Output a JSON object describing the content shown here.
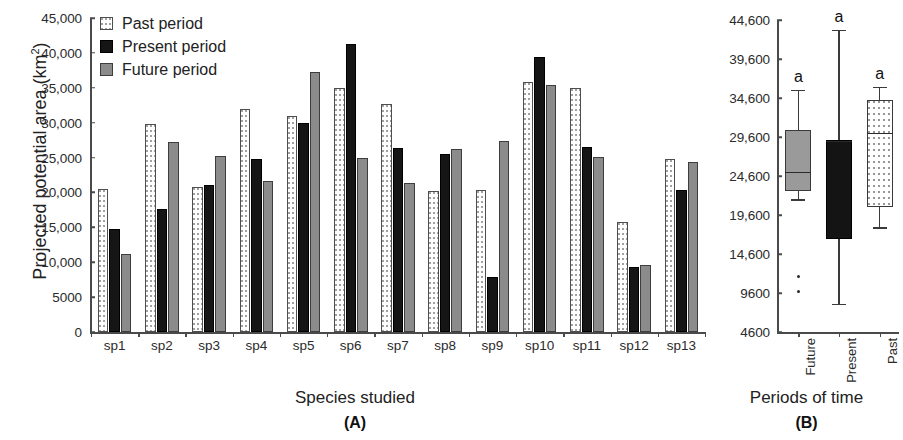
{
  "chart_data": [
    {
      "type": "bar",
      "panel": "(A)",
      "title": "",
      "xlabel": "Species studied",
      "ylabel": "Projected potential area (km2)",
      "ylabel_base": "Projected potential area (km",
      "ylabel_sup": "2",
      "ylabel_tail": ")",
      "ylim": [
        0,
        45000
      ],
      "ytick_step": 5000,
      "yticks": [
        "0",
        "5000",
        "10,000",
        "15,000",
        "20,000",
        "25,000",
        "30,000",
        "35,000",
        "40,000",
        "45,000"
      ],
      "ytick_values": [
        0,
        5000,
        10000,
        15000,
        20000,
        25000,
        30000,
        35000,
        40000,
        45000
      ],
      "grid": false,
      "legend_position": "top-left",
      "categories": [
        "sp1",
        "sp2",
        "sp3",
        "sp4",
        "sp5",
        "sp6",
        "sp7",
        "sp8",
        "sp9",
        "sp10",
        "sp11",
        "sp12",
        "sp13"
      ],
      "series": [
        {
          "name": "Past period",
          "key": "past",
          "values": [
            20500,
            29800,
            20800,
            32000,
            31000,
            34900,
            32700,
            20200,
            20300,
            35800,
            34900,
            15800,
            24800
          ]
        },
        {
          "name": "Present period",
          "key": "present",
          "values": [
            14800,
            17700,
            21000,
            24800,
            29900,
            41300,
            26400,
            25500,
            7900,
            39400,
            26500,
            9300,
            20300
          ]
        },
        {
          "name": "Future period",
          "key": "future",
          "values": [
            11200,
            27300,
            25200,
            21700,
            37300,
            25000,
            21300,
            26300,
            27400,
            35400,
            25100,
            9600,
            24400
          ]
        }
      ]
    },
    {
      "type": "boxplot",
      "panel": "(B)",
      "title": "",
      "xlabel": "Periods of time",
      "ylabel": "",
      "ylim": [
        4600,
        44600
      ],
      "ytick_step": 5000,
      "yticks": [
        "4600",
        "9600",
        "14,600",
        "19,600",
        "24,600",
        "29,600",
        "34,600",
        "39,600",
        "44,600"
      ],
      "ytick_values": [
        4600,
        9600,
        14600,
        19600,
        24600,
        29600,
        34600,
        39600,
        44600
      ],
      "grid": false,
      "categories": [
        "Future",
        "Present",
        "Past"
      ],
      "boxes": [
        {
          "name": "Future",
          "key": "future",
          "whisker_low": 21600,
          "q1": 22700,
          "median": 25100,
          "q3": 30500,
          "whisker_high": 35600,
          "outliers": [
            11700,
            9800
          ],
          "sig_letter": "a"
        },
        {
          "name": "Present",
          "key": "present",
          "whisker_low": 8200,
          "q1": 16500,
          "median": 29100,
          "q3": 29200,
          "whisker_high": 43300,
          "outliers": [],
          "sig_letter": "a"
        },
        {
          "name": "Past",
          "key": "past",
          "whisker_low": 18000,
          "q1": 20600,
          "median": 30100,
          "q3": 34400,
          "whisker_high": 36000,
          "outliers": [],
          "sig_letter": "a"
        }
      ]
    }
  ],
  "panelA": {
    "ylabel_base": "Projected potential area (km",
    "ylabel_sup": "2",
    "ylabel_tail": ")",
    "xtitle": "Species studied",
    "tag": "(A)",
    "legend": [
      {
        "label": "Past period",
        "key": "past"
      },
      {
        "label": "Present period",
        "key": "present"
      },
      {
        "label": "Future period",
        "key": "future"
      }
    ]
  },
  "panelB": {
    "xtitle": "Periods of time",
    "tag": "(B)"
  },
  "colors": {
    "past_fill": "#ffffff",
    "present_fill": "#151515",
    "future_fill": "#8b8b8b",
    "axis": "#4a4a4a",
    "text": "#222222"
  }
}
